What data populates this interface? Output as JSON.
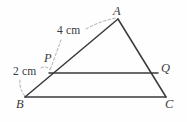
{
  "figure": {
    "type": "geometry-diagram",
    "background_color": "#fefefe",
    "stroke_color": "#3a3a3e",
    "leader_color": "#9a9aa0",
    "vertices": {
      "A": {
        "label": "A",
        "x": 118,
        "y": 19
      },
      "B": {
        "label": "B",
        "x": 25,
        "y": 97
      },
      "C": {
        "label": "C",
        "x": 166,
        "y": 97
      },
      "P": {
        "label": "P",
        "x": 49,
        "y": 73
      },
      "Q": {
        "label": "Q",
        "x": 158,
        "y": 73
      }
    },
    "segments": [
      {
        "name": "AB",
        "from": "A",
        "to": "B"
      },
      {
        "name": "AC",
        "from": "A",
        "to": "C"
      },
      {
        "name": "BC",
        "from": "B",
        "to": "C"
      },
      {
        "name": "PQ",
        "from": "P",
        "to": "Q"
      }
    ],
    "measurements": [
      {
        "name": "PA",
        "label": "4 cm",
        "value": 4,
        "unit": "cm",
        "segment": "P to A"
      },
      {
        "name": "BP",
        "label": "2 cm",
        "value": 2,
        "unit": "cm",
        "segment": "B to P"
      }
    ]
  }
}
